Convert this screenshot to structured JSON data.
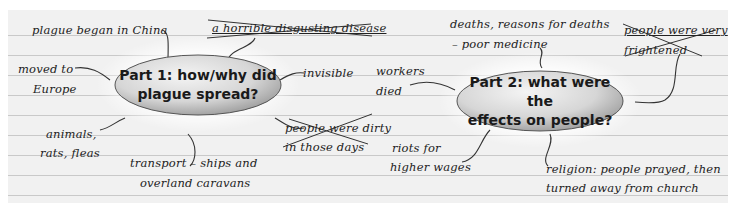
{
  "mindmaps": [
    {
      "center": {
        "line1": "Part 1: how/why did",
        "line2": "plague spread?"
      },
      "notes": {
        "china": "plague began in China",
        "disease": "a horrible disgusting disease",
        "moved1": "moved to",
        "moved2": "Europe",
        "invisible": "invisible",
        "animals1": "animals,",
        "animals2": "rats, fleas",
        "dirty1": "people were dirty",
        "dirty2": "in those days",
        "transport1": "transport – ships and",
        "transport2": "overland caravans"
      },
      "crossed_out": [
        "a horrible disgusting disease",
        "people were dirty in those days"
      ]
    },
    {
      "center": {
        "line1": "Part 2: what were the",
        "line2": "effects on people?"
      },
      "notes": {
        "deaths1": "deaths, reasons for deaths",
        "deaths2": "– poor medicine",
        "frightened1": "people were very",
        "frightened2": "frightened",
        "workers1": "workers",
        "workers2": "died",
        "riots1": "riots for",
        "riots2": "higher wages",
        "religion1": "religion: people prayed, then",
        "religion2": "turned away from church"
      },
      "crossed_out": [
        "people were very frightened"
      ]
    }
  ]
}
